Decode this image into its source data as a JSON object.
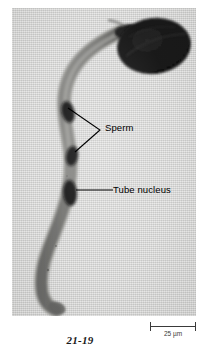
{
  "figure": {
    "number": "21-19",
    "type": "light micrograph"
  },
  "micrograph": {
    "background_color": "#d5d5d4",
    "specimen_color": "#4a4a48",
    "nucleus_color": "#141414",
    "grain_color": "#0b0b0b",
    "description": "Dark pollen grain at upper right with a long S-curved pollen tube extending downward and to the left; three darkly stained nuclei are visible within the tube."
  },
  "annotations": [
    {
      "id": "sperm",
      "label": "Sperm",
      "leader": "two-branch V leader pointing to the upper two dark nuclei"
    },
    {
      "id": "tube-nucleus",
      "label": "Tube nucleus",
      "leader": "single horizontal leader pointing to the lowest dark nucleus"
    }
  ],
  "scale_bar": {
    "label": "25 µm",
    "value": "25",
    "units": "µm",
    "color": "#3a3a3a"
  }
}
